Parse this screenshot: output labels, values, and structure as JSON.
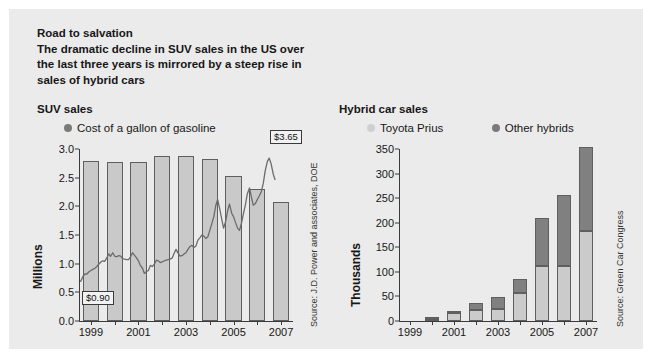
{
  "headline": {
    "title": "Road to salvation",
    "subtitle_lines": [
      "The dramatic decline in SUV sales in the US over",
      "the last three years is mirrored by a steep rise in",
      "sales of hybrid cars"
    ]
  },
  "colors": {
    "panel_background": "#ebebeb",
    "bar_fill": "#c9c9c9",
    "bar_stroke": "#5f5f5f",
    "prius_fill": "#cbcbcb",
    "other_hybrids_fill": "#808080",
    "line_color": "#6b6b6b",
    "text": "#171717"
  },
  "left_panel": {
    "title": "SUV sales",
    "legend": [
      {
        "label": "Cost of a gallon of gasoline",
        "swatch": "dot-dark",
        "icon": "legend-dot-icon"
      }
    ],
    "source": "Source: J.D. Power and associates, DOE",
    "callouts": [
      {
        "label": "$0.90",
        "x_year": 1999.0,
        "value": 0.9
      },
      {
        "label": "$3.65",
        "x_year": 2006.7,
        "value": 3.65
      }
    ]
  },
  "right_panel": {
    "title": "Hybrid car sales",
    "legend": [
      {
        "label": "Toyota Prius",
        "swatch": "dot-light",
        "icon": "legend-dot-icon"
      },
      {
        "label": "Other hybrids",
        "swatch": "dot-dark",
        "icon": "legend-dot-icon"
      }
    ],
    "source": "Source: Green Car Congress"
  },
  "chart_data": [
    {
      "id": "suv-sales",
      "type": "bar",
      "title": "SUV sales",
      "xlabel": "",
      "ylabel": "Millions",
      "ylim": [
        0.0,
        3.0
      ],
      "ytick_values": [
        0.0,
        0.5,
        1.0,
        1.5,
        2.0,
        2.5,
        3.0
      ],
      "ytick_labels": [
        "0.0",
        "0.5",
        "1.0",
        "1.5",
        "2.0",
        "2.5",
        "3.0"
      ],
      "grid": false,
      "legend_position": "top",
      "categories": [
        1999,
        2000,
        2001,
        2002,
        2003,
        2004,
        2005,
        2006,
        2007
      ],
      "xtick_labels": [
        "1999",
        "",
        "2001",
        "",
        "2003",
        "",
        "2005",
        "",
        "2007"
      ],
      "values": [
        2.79,
        2.77,
        2.77,
        2.87,
        2.87,
        2.83,
        2.53,
        2.3,
        2.07
      ],
      "overlay": {
        "name": "Cost of a gallon of gasoline",
        "type": "line",
        "unit": "USD per gallon",
        "axis": "shared-scaled",
        "note": "Line plotted on same 0-3 frame; values in dollars mapped 1:1 onto the Millions scale",
        "points": [
          [
            1999.0,
            0.68
          ],
          [
            1999.08,
            0.7
          ],
          [
            1999.17,
            0.78
          ],
          [
            1999.25,
            0.82
          ],
          [
            1999.33,
            0.82
          ],
          [
            1999.42,
            0.86
          ],
          [
            1999.5,
            0.88
          ],
          [
            1999.58,
            0.9
          ],
          [
            1999.67,
            0.92
          ],
          [
            1999.75,
            0.95
          ],
          [
            1999.83,
            0.99
          ],
          [
            1999.92,
            1.03
          ],
          [
            2000.0,
            1.05
          ],
          [
            2000.08,
            1.04
          ],
          [
            2000.17,
            1.1
          ],
          [
            2000.25,
            1.17
          ],
          [
            2000.33,
            1.13
          ],
          [
            2000.42,
            1.19
          ],
          [
            2000.5,
            1.13
          ],
          [
            2000.58,
            1.12
          ],
          [
            2000.67,
            1.14
          ],
          [
            2000.75,
            1.13
          ],
          [
            2000.83,
            1.09
          ],
          [
            2000.92,
            1.08
          ],
          [
            2001.0,
            1.07
          ],
          [
            2001.08,
            1.07
          ],
          [
            2001.17,
            1.12
          ],
          [
            2001.25,
            1.19
          ],
          [
            2001.33,
            1.15
          ],
          [
            2001.42,
            1.1
          ],
          [
            2001.5,
            1.05
          ],
          [
            2001.58,
            0.97
          ],
          [
            2001.67,
            0.92
          ],
          [
            2001.75,
            0.83
          ],
          [
            2001.83,
            0.86
          ],
          [
            2001.92,
            0.88
          ],
          [
            2002.0,
            0.97
          ],
          [
            2002.08,
            0.95
          ],
          [
            2002.17,
            0.99
          ],
          [
            2002.25,
            1.06
          ],
          [
            2002.33,
            1.05
          ],
          [
            2002.42,
            1.02
          ],
          [
            2002.5,
            1.03
          ],
          [
            2002.58,
            1.05
          ],
          [
            2002.67,
            1.06
          ],
          [
            2002.75,
            1.07
          ],
          [
            2002.83,
            1.08
          ],
          [
            2002.92,
            1.1
          ],
          [
            2003.0,
            1.18
          ],
          [
            2003.08,
            1.25
          ],
          [
            2003.17,
            1.18
          ],
          [
            2003.25,
            1.13
          ],
          [
            2003.33,
            1.14
          ],
          [
            2003.42,
            1.17
          ],
          [
            2003.5,
            1.19
          ],
          [
            2003.58,
            1.25
          ],
          [
            2003.67,
            1.3
          ],
          [
            2003.75,
            1.32
          ],
          [
            2003.83,
            1.28
          ],
          [
            2003.92,
            1.31
          ],
          [
            2004.0,
            1.41
          ],
          [
            2004.08,
            1.45
          ],
          [
            2004.17,
            1.5
          ],
          [
            2004.25,
            1.48
          ],
          [
            2004.33,
            1.44
          ],
          [
            2004.42,
            1.47
          ],
          [
            2004.5,
            1.58
          ],
          [
            2004.58,
            1.69
          ],
          [
            2004.67,
            1.82
          ],
          [
            2004.75,
            2.01
          ],
          [
            2004.83,
            2.12
          ],
          [
            2004.92,
            1.95
          ],
          [
            2005.0,
            1.78
          ],
          [
            2005.08,
            1.62
          ],
          [
            2005.17,
            1.74
          ],
          [
            2005.25,
            1.92
          ],
          [
            2005.33,
            2.04
          ],
          [
            2005.42,
            1.88
          ],
          [
            2005.5,
            1.82
          ],
          [
            2005.58,
            1.72
          ],
          [
            2005.67,
            1.62
          ],
          [
            2005.75,
            1.58
          ],
          [
            2005.83,
            1.7
          ],
          [
            2005.92,
            1.88
          ],
          [
            2006.0,
            2.03
          ],
          [
            2006.08,
            2.22
          ],
          [
            2006.17,
            2.32
          ],
          [
            2006.25,
            2.16
          ],
          [
            2006.33,
            2.02
          ],
          [
            2006.42,
            2.05
          ],
          [
            2006.5,
            2.12
          ],
          [
            2006.58,
            2.18
          ],
          [
            2006.67,
            2.26
          ],
          [
            2006.75,
            2.4
          ],
          [
            2006.83,
            2.62
          ],
          [
            2006.92,
            2.78
          ],
          [
            2007.0,
            2.84
          ],
          [
            2007.08,
            2.74
          ],
          [
            2007.17,
            2.56
          ],
          [
            2007.25,
            2.46
          ]
        ]
      }
    },
    {
      "id": "hybrid-car-sales",
      "type": "bar",
      "stacked": true,
      "title": "Hybrid car sales",
      "xlabel": "",
      "ylabel": "Thousands",
      "ylim": [
        0,
        350
      ],
      "ytick_values": [
        0,
        50,
        100,
        150,
        200,
        250,
        300,
        350
      ],
      "ytick_labels": [
        "0",
        "50",
        "100",
        "150",
        "200",
        "250",
        "300",
        "350"
      ],
      "grid": false,
      "legend_position": "top",
      "categories": [
        1999,
        2000,
        2001,
        2002,
        2003,
        2004,
        2005,
        2006,
        2007
      ],
      "xtick_labels": [
        "1999",
        "",
        "2001",
        "",
        "2003",
        "",
        "2005",
        "",
        "2007"
      ],
      "series": [
        {
          "name": "Toyota Prius",
          "values": [
            0,
            5,
            16,
            22,
            25,
            56,
            111,
            111,
            184
          ]
        },
        {
          "name": "Other hybrids",
          "values": [
            0,
            4,
            5,
            15,
            24,
            30,
            99,
            145,
            170
          ]
        }
      ],
      "totals": [
        0,
        9,
        21,
        37,
        49,
        86,
        210,
        256,
        354
      ]
    }
  ]
}
